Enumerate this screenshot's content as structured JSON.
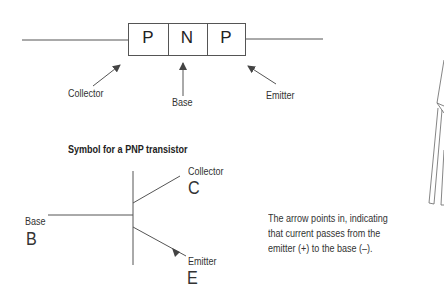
{
  "junction_diagram": {
    "layers": [
      "P",
      "N",
      "P"
    ],
    "labels": {
      "collector": "Collector",
      "base": "Base",
      "emitter": "Emitter"
    }
  },
  "symbol": {
    "title": "Symbol for a PNP transistor",
    "collector_label": "Collector",
    "collector_letter": "C",
    "base_label": "Base",
    "base_letter": "B",
    "emitter_label": "Emitter",
    "emitter_letter": "E"
  },
  "note": {
    "lines": [
      "The arrow points in, indicating",
      "that current passes from the",
      "emitter (+) to the base (–)."
    ]
  },
  "colors": {
    "line": "#555555",
    "text": "#333333"
  }
}
